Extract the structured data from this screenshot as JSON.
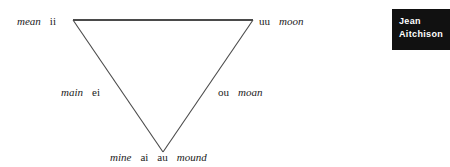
{
  "figure": {
    "type": "vowel-triangle-diagram",
    "line_color": "#4a4a4a",
    "text_color": "#1b1b1b",
    "background": "#ffffff",
    "vertices": {
      "close_front": {
        "x": 73,
        "y": 20
      },
      "close_back": {
        "x": 253,
        "y": 20
      },
      "open": {
        "x": 163,
        "y": 152
      }
    },
    "labels": {
      "close_front": {
        "word": "mean",
        "symbol": "ii"
      },
      "close_back": {
        "symbol": "uu",
        "word": "moon"
      },
      "mid_front": {
        "word": "main",
        "symbol": "ei"
      },
      "mid_back": {
        "symbol": "ou",
        "word": "moan"
      },
      "open": {
        "word_left": "mine",
        "symbol_left": "ai",
        "symbol_right": "au",
        "word_right": "mound"
      }
    }
  },
  "author_badge": {
    "background": "#111111",
    "text_color": "#ffffff",
    "line1": "Jean",
    "line2": "Aitchison"
  }
}
